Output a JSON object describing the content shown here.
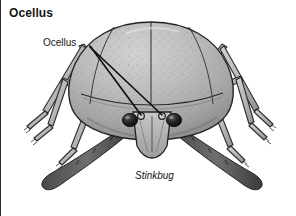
{
  "figure": {
    "heading": "Ocellus",
    "callout_label": "Ocellus",
    "caption": "Stinkbug",
    "colors": {
      "background": "#ffffff",
      "ink": "#151515",
      "shell_light": "#c6c6c6",
      "shell_mid": "#ababab",
      "shell_shadow": "#8e8e8e",
      "leg_fill": "#bdbdbd",
      "eye_dark": "#1a1a1a",
      "leader_line": "#111111",
      "frame_border": "#2b2b2b"
    },
    "annotations": {
      "leader_lines": [
        {
          "name": "leader-to-left-ocellus",
          "x1": 89,
          "y1": 46,
          "x2": 140,
          "y2": 116
        },
        {
          "name": "leader-to-right-ocellus",
          "x1": 89,
          "y1": 47,
          "x2": 161,
          "y2": 116
        }
      ],
      "ocelli": [
        {
          "name": "left-ocellus",
          "cx": 140,
          "cy": 116,
          "r": 3.2
        },
        {
          "name": "right-ocellus",
          "cx": 161,
          "cy": 116,
          "r": 3.2
        }
      ],
      "compound_eyes": [
        {
          "name": "left-compound-eye",
          "cx": 129,
          "cy": 120,
          "rx": 7.5,
          "ry": 6.5
        },
        {
          "name": "right-compound-eye",
          "cx": 173,
          "cy": 120,
          "rx": 7.5,
          "ry": 6.5
        }
      ]
    }
  }
}
